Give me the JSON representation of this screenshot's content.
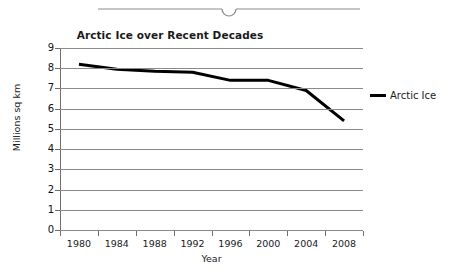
{
  "top_bar": {
    "name": "divider-handle",
    "description": "thin horizontal rule with centered semicircular notch"
  },
  "chart_data": {
    "type": "line",
    "title": "Arctic Ice over Recent Decades",
    "xlabel": "Year",
    "ylabel": "Millions sq km",
    "grid": true,
    "legend_position": "right",
    "xlim": [
      1978,
      2010
    ],
    "ylim": [
      0,
      9
    ],
    "ytick_labels": [
      "9",
      "8",
      "7",
      "6",
      "5",
      "4",
      "3",
      "2",
      "1",
      "0"
    ],
    "ytick_values": [
      9,
      8,
      7,
      6,
      5,
      4,
      3,
      2,
      1,
      0
    ],
    "xtick_labels": [
      "1980",
      "1984",
      "1988",
      "1992",
      "1996",
      "2000",
      "2004",
      "2008"
    ],
    "xtick_values": [
      1980,
      1984,
      1988,
      1992,
      1996,
      2000,
      2004,
      2008
    ],
    "series": [
      {
        "name": "Arctic Ice",
        "color": "#000000",
        "x": [
          1980,
          1984,
          1988,
          1992,
          1996,
          2000,
          2004,
          2008
        ],
        "values": [
          8.2,
          7.95,
          7.85,
          7.8,
          7.4,
          7.4,
          6.9,
          5.4
        ]
      }
    ]
  },
  "legend": {
    "entries": [
      {
        "label": "Arctic Ice",
        "color": "#000000"
      }
    ]
  }
}
